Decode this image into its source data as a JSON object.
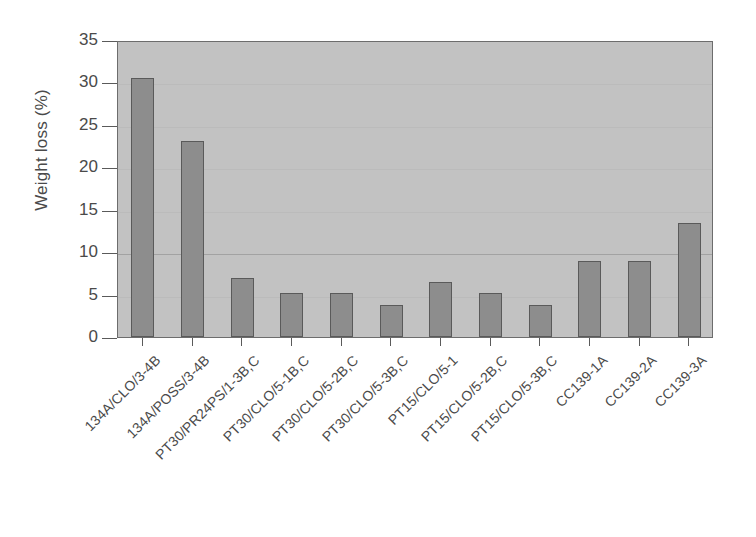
{
  "chart_data": {
    "type": "bar",
    "title": "",
    "subtitle": "",
    "xlabel": "",
    "ylabel": "Weight loss (%)",
    "ylim": [
      0,
      35
    ],
    "yticks": [
      0,
      5,
      10,
      15,
      20,
      25,
      30,
      35
    ],
    "grid": true,
    "grid_axis": "y",
    "legend": "none",
    "categories": [
      "134A/CLO/3-4B",
      "134A/POSS/3-4B",
      "PT30/PR24PS/1-3B,C",
      "PT30/CLO/5-1B,C",
      "PT30/CLO/5-2B,C",
      "PT30/CLO/5-3B,C",
      "PT15/CLO/5-1",
      "PT15/CLO/5-2B,C",
      "PT15/CLO/5-3B,C",
      "CC139-1A",
      "CC139-2A",
      "CC139-3A"
    ],
    "values": [
      30.5,
      23.1,
      7.0,
      5.2,
      5.2,
      3.8,
      6.5,
      5.2,
      3.8,
      9.0,
      9.0,
      13.4
    ],
    "colors": {
      "plot_background": "#c2c2c2",
      "bar_fill": "#8d8d8d",
      "bar_edge": "#5a5a5a",
      "axis": "#5a5a5a",
      "grid": "#9a9a9a",
      "text": "#4a4a4a",
      "figure_background": "#ffffff"
    }
  }
}
